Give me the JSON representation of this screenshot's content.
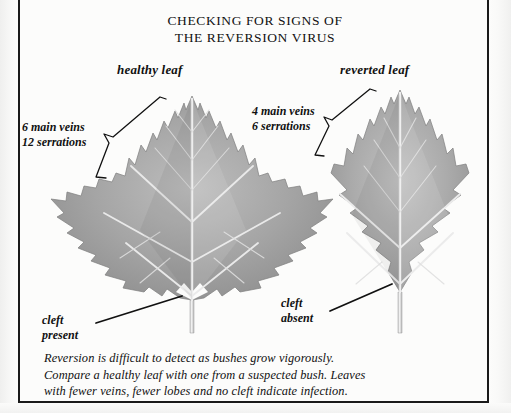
{
  "page": {
    "title_lines": [
      "CHECKING FOR SIGNS OF",
      "THE REVERSION VIRUS"
    ],
    "background_color": "#fcfcfb",
    "rule_color": "#1a1a1a"
  },
  "figure": {
    "healthy": {
      "caption": "healthy leaf",
      "vein_annotation_lines": [
        "6 main veins",
        "12 serrations"
      ],
      "cleft_annotation_lines": [
        "cleft",
        "present"
      ],
      "main_veins": 6,
      "serrations": 12,
      "cleft": "present",
      "leaf_fill_color": "#9c9c9c",
      "leaf_vein_color": "#e8e8e8"
    },
    "reverted": {
      "caption": "reverted leaf",
      "vein_annotation_lines": [
        "4 main veins",
        "6 serrations"
      ],
      "cleft_annotation_lines": [
        "cleft",
        "absent"
      ],
      "main_veins": 4,
      "serrations": 6,
      "cleft": "absent",
      "leaf_fill_color": "#a2a2a2",
      "leaf_vein_color": "#ececec"
    }
  },
  "footnote": {
    "lines": [
      "Reversion is difficult to detect as bushes grow vigorously.",
      "Compare a healthy leaf with one from a suspected bush. Leaves",
      "with fewer veins, fewer lobes and no cleft indicate infection."
    ]
  }
}
